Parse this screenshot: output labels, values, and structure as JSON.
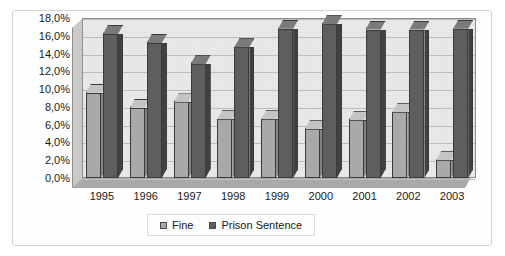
{
  "chart_data": {
    "type": "bar",
    "title": "",
    "xlabel": "",
    "ylabel": "",
    "categories": [
      "1995",
      "1996",
      "1997",
      "1998",
      "1999",
      "2000",
      "2001",
      "2002",
      "2003"
    ],
    "series": [
      {
        "name": "Fine",
        "color": "#a9a9a9",
        "values": [
          9.6,
          7.9,
          8.5,
          6.6,
          6.6,
          5.5,
          6.5,
          7.4,
          2.0
        ]
      },
      {
        "name": "Prison Sentence",
        "color": "#5e5e5e",
        "values": [
          16.2,
          15.2,
          12.8,
          14.7,
          16.8,
          17.3,
          16.7,
          16.7,
          16.8
        ]
      }
    ],
    "ylim": [
      0,
      18
    ],
    "ytick_values": [
      18,
      16,
      14,
      12,
      10,
      8,
      6,
      4,
      2,
      0
    ],
    "ytick_labels": [
      "18,0%",
      "16,0%",
      "14,0%",
      "12,0%",
      "10,0%",
      "8,0%",
      "6,0%",
      "4,0%",
      "2,0%",
      "0,0%"
    ],
    "grid": true,
    "legend_position": "bottom",
    "style": "3d-column"
  },
  "legend": {
    "items": [
      {
        "label": "Fine",
        "swatch": "fine"
      },
      {
        "label": "Prison Sentence",
        "swatch": "prison"
      }
    ]
  }
}
